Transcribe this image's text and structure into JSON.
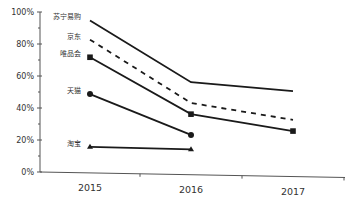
{
  "chart_data": {
    "type": "line",
    "title": "",
    "xlabel": "",
    "ylabel": "",
    "categories": [
      "2015",
      "2016",
      "2017"
    ],
    "ylim": [
      0,
      100
    ],
    "yticks": [
      "0%",
      "20%",
      "40%",
      "60%",
      "80%",
      "100%"
    ],
    "grid": false,
    "legend": "inline labels at 2015 start points",
    "series": [
      {
        "name": "苏宁易购",
        "values": [
          95,
          57,
          52
        ],
        "style": "solid",
        "marker": "none"
      },
      {
        "name": "京东",
        "values": [
          83,
          44,
          34
        ],
        "style": "dashed",
        "marker": "none"
      },
      {
        "name": "唯品会",
        "values": [
          72,
          37,
          27
        ],
        "style": "solid",
        "marker": "square"
      },
      {
        "name": "天猫",
        "values": [
          49,
          24,
          null
        ],
        "style": "solid",
        "marker": "circle"
      },
      {
        "name": "淘宝",
        "values": [
          16,
          15,
          null
        ],
        "style": "solid",
        "marker": "triangle"
      }
    ]
  },
  "colors": {
    "line": "#1a1a1a",
    "axis": "#555555",
    "text": "#333333"
  }
}
